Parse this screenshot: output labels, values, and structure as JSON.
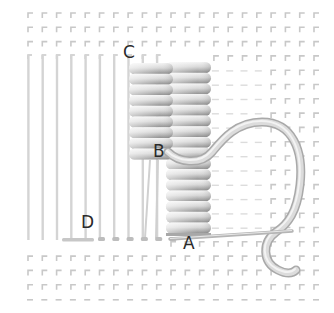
{
  "diagram": {
    "type": "embroidery-stitch-illustration",
    "colors": {
      "background": "#ffffff",
      "grid_mark": "#c8c8c8",
      "laid_thread": "#d4d4d4",
      "wrap_light": "#f2f2f2",
      "wrap_dark": "#9a9a9a",
      "working_thread": "#c9c9c9",
      "label": "#2a2a2a"
    },
    "grid": {
      "x0": 28,
      "y0": 13,
      "step": 14.3,
      "cols": 21,
      "rows": 21
    },
    "labels": [
      {
        "id": "C",
        "text": "C",
        "x": 123,
        "y": 44
      },
      {
        "id": "B",
        "text": "B",
        "x": 153,
        "y": 143
      },
      {
        "id": "D",
        "text": "D",
        "x": 81,
        "y": 214
      },
      {
        "id": "A",
        "text": "A",
        "x": 183,
        "y": 235
      }
    ]
  }
}
